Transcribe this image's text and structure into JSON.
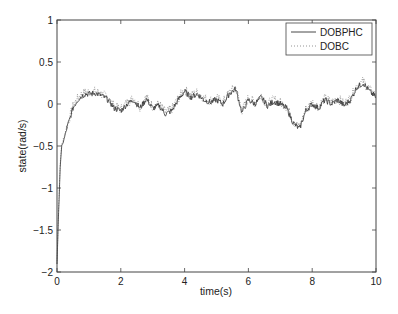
{
  "chart_data": {
    "type": "line",
    "title": "",
    "xlabel": "time(s)",
    "ylabel": "state(rad/s)",
    "xlim": [
      0,
      10
    ],
    "ylim": [
      -2,
      1
    ],
    "xticks": [
      0,
      2,
      4,
      6,
      8,
      10
    ],
    "yticks": [
      1,
      0.5,
      0,
      -0.5,
      -1,
      -1.5,
      -2
    ],
    "xtick_labels": [
      "0",
      "2",
      "4",
      "6",
      "8",
      "10"
    ],
    "ytick_labels": [
      "1",
      "0.5",
      "0",
      "−0.5",
      "−1",
      "−1.5",
      "−2"
    ],
    "grid": false,
    "legend_position": "upper right",
    "series": [
      {
        "name": "DOBPHC",
        "style": "solid",
        "color": "#333333",
        "x": [
          0,
          0.05,
          0.1,
          0.15,
          0.2,
          0.3,
          0.4,
          0.5,
          0.6,
          0.7,
          0.8,
          0.9,
          1.0,
          1.2,
          1.4,
          1.6,
          1.8,
          2.0,
          2.2,
          2.4,
          2.6,
          2.8,
          3.0,
          3.2,
          3.4,
          3.6,
          3.8,
          4.0,
          4.2,
          4.4,
          4.6,
          4.8,
          5.0,
          5.2,
          5.4,
          5.6,
          5.8,
          6.0,
          6.2,
          6.4,
          6.6,
          6.8,
          7.0,
          7.2,
          7.4,
          7.6,
          7.8,
          8.0,
          8.2,
          8.4,
          8.6,
          8.8,
          9.0,
          9.2,
          9.4,
          9.6,
          9.8,
          10.0
        ],
        "values": [
          -1.9,
          -1.3,
          -0.75,
          -0.5,
          -0.45,
          -0.3,
          -0.18,
          -0.05,
          0.02,
          0.07,
          0.1,
          0.12,
          0.12,
          0.13,
          0.1,
          0.05,
          -0.05,
          -0.08,
          0.0,
          0.05,
          -0.05,
          0.06,
          -0.05,
          -0.02,
          -0.12,
          -0.08,
          0.05,
          0.15,
          0.08,
          0.12,
          0.05,
          0.02,
          0.05,
          0.0,
          0.12,
          0.18,
          -0.1,
          0.05,
          0.0,
          0.08,
          -0.02,
          0.03,
          0.0,
          -0.05,
          -0.22,
          -0.3,
          -0.08,
          0.0,
          -0.05,
          0.05,
          0.0,
          0.05,
          -0.02,
          0.05,
          0.2,
          0.25,
          0.15,
          0.08
        ]
      },
      {
        "name": "DOBC",
        "style": "dotted",
        "color": "#777777",
        "x": [
          0,
          0.05,
          0.1,
          0.15,
          0.2,
          0.3,
          0.4,
          0.5,
          0.6,
          0.7,
          0.8,
          0.9,
          1.0,
          1.2,
          1.4,
          1.6,
          1.8,
          2.0,
          2.2,
          2.4,
          2.6,
          2.8,
          3.0,
          3.2,
          3.4,
          3.6,
          3.8,
          4.0,
          4.2,
          4.4,
          4.6,
          4.8,
          5.0,
          5.2,
          5.4,
          5.6,
          5.8,
          6.0,
          6.2,
          6.4,
          6.6,
          6.8,
          7.0,
          7.2,
          7.4,
          7.6,
          7.8,
          8.0,
          8.2,
          8.4,
          8.6,
          8.8,
          9.0,
          9.2,
          9.4,
          9.6,
          9.8,
          10.0
        ],
        "values": [
          -1.9,
          -1.25,
          -0.7,
          -0.48,
          -0.42,
          -0.28,
          -0.16,
          -0.03,
          0.04,
          0.09,
          0.12,
          0.14,
          0.14,
          0.15,
          0.12,
          0.07,
          -0.03,
          -0.06,
          0.02,
          0.07,
          -0.03,
          0.08,
          -0.03,
          0.0,
          -0.1,
          -0.06,
          0.07,
          0.17,
          0.1,
          0.14,
          0.07,
          0.04,
          0.07,
          0.02,
          0.14,
          0.2,
          -0.08,
          0.07,
          0.02,
          0.1,
          0.0,
          0.05,
          0.02,
          -0.03,
          -0.2,
          -0.28,
          -0.06,
          0.02,
          -0.03,
          0.07,
          0.02,
          0.07,
          0.0,
          0.07,
          0.22,
          0.27,
          0.17,
          0.1
        ]
      }
    ]
  },
  "legend": {
    "items": [
      {
        "label": "DOBPHC",
        "style": "solid"
      },
      {
        "label": "DOBC",
        "style": "dotted"
      }
    ]
  },
  "axes": {
    "xlabel": "time(s)",
    "ylabel": "state(rad/s)"
  }
}
